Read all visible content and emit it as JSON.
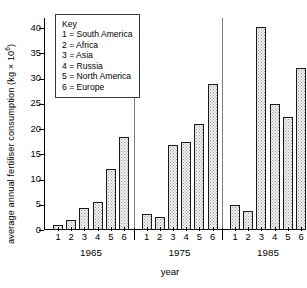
{
  "chart_data": {
    "type": "bar",
    "title": "",
    "subtitle": "",
    "xlabel": "year",
    "ylabel": "average annual fertiliser consumption (kg × 10",
    "ylabel_exponent": "6",
    "ylabel_suffix": ")",
    "ylim": [
      0,
      42
    ],
    "yticks": [
      0,
      5,
      10,
      15,
      20,
      25,
      30,
      35,
      40
    ],
    "ytick_labels": [
      "0",
      "5",
      "10",
      "15",
      "20",
      "25",
      "30",
      "35",
      "40"
    ],
    "grid": false,
    "legend_position": "upper-left-inset",
    "categories": [
      "1",
      "2",
      "3",
      "4",
      "5",
      "6"
    ],
    "groups": [
      "1965",
      "1975",
      "1985"
    ],
    "series": [
      {
        "name": "1965",
        "values": [
          1.0,
          2.0,
          4.4,
          5.6,
          12.0,
          18.5
        ]
      },
      {
        "name": "1975",
        "values": [
          3.2,
          2.5,
          16.8,
          17.5,
          21.0,
          28.9
        ]
      },
      {
        "name": "1985",
        "values": [
          4.9,
          3.7,
          40.2,
          25.0,
          22.4,
          32.0
        ]
      }
    ],
    "bar_fill": "#f2f2f2",
    "bar_edge": "#1a1a1a",
    "axis_color": "#000000",
    "separator_color": "#7d7d7d"
  },
  "key": {
    "title": "Key",
    "entries": [
      {
        "code": "1",
        "eq": "=",
        "label": "South America",
        "text": "1 = South America"
      },
      {
        "code": "2",
        "eq": "=",
        "label": "Africa",
        "text": "2 = Africa"
      },
      {
        "code": "3",
        "eq": "=",
        "label": "Asia",
        "text": "3 = Asia"
      },
      {
        "code": "4",
        "eq": "=",
        "label": "Russia",
        "text": "4 = Russia"
      },
      {
        "code": "5",
        "eq": "=",
        "label": "North America",
        "text": "5 = North America"
      },
      {
        "code": "6",
        "eq": "=",
        "label": "Europe",
        "text": "6 = Europe"
      }
    ]
  }
}
